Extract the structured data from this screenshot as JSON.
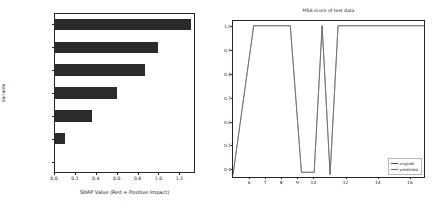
{
  "figure": {
    "width": 436,
    "height": 208,
    "background": "#ffffff"
  },
  "chart_data": [
    {
      "type": "bar",
      "orientation": "horizontal",
      "title": "",
      "xlabel": "SHAP Value (Red = Positive Impact)",
      "ylabel": "Variable",
      "categories": [
        "Quality",
        "ReqpTime",
        "cRework",
        "cAQPM",
        "ExperTime",
        "DelayTime",
        "Wage"
      ],
      "values": [
        1.31,
        1.0,
        0.87,
        0.6,
        0.36,
        0.11,
        0.0
      ],
      "xlim": [
        0.0,
        1.35
      ],
      "xticks": [
        0.0,
        0.2,
        0.4,
        0.6,
        0.8,
        1.0,
        1.2
      ],
      "xtick_labels": [
        "0.0",
        "0.2",
        "0.4",
        "0.6",
        "0.8",
        "1.0",
        "1.2"
      ],
      "bar_color": "#2b2b2b",
      "grid": false,
      "legend": false
    },
    {
      "type": "line",
      "title": "MSA score of test data",
      "xlabel": "",
      "ylabel": "",
      "xlim": [
        5.0,
        17.0
      ],
      "ylim": [
        0.36,
        1.02
      ],
      "xticks": [
        6,
        7,
        8,
        9,
        10,
        12,
        14,
        16
      ],
      "xtick_labels": [
        "6",
        "7",
        "8",
        "9",
        "10",
        "12",
        "14",
        "16"
      ],
      "yticks": [
        0.4,
        0.5,
        0.6,
        0.7,
        0.8,
        0.9,
        1.0
      ],
      "ytick_labels": [
        "0.4",
        "0.5",
        "0.6",
        "0.7",
        "0.8",
        "0.9",
        "1.0"
      ],
      "grid": false,
      "legend": true,
      "legend_position": "lower right",
      "series": [
        {
          "name": "original",
          "color": "#4a4a4a",
          "x": [
            5.0,
            6.3,
            8.6,
            9.3,
            10.1,
            10.6,
            11.1,
            11.6,
            17.0
          ],
          "y": [
            0.37,
            1.0,
            1.0,
            0.38,
            0.38,
            1.0,
            0.37,
            1.0,
            1.0
          ]
        },
        {
          "name": "predicted",
          "color": "#6e6e6e",
          "x": [
            5.0,
            6.3,
            8.6,
            9.3,
            10.1,
            10.6,
            11.1,
            11.6,
            17.0
          ],
          "y": [
            0.37,
            1.0,
            1.0,
            0.38,
            0.38,
            1.0,
            0.37,
            1.0,
            1.0
          ]
        }
      ]
    }
  ],
  "legend": {
    "items": [
      {
        "label": "original",
        "color": "#4a4a4a"
      },
      {
        "label": "predicted",
        "color": "#6e6e6e"
      }
    ]
  }
}
